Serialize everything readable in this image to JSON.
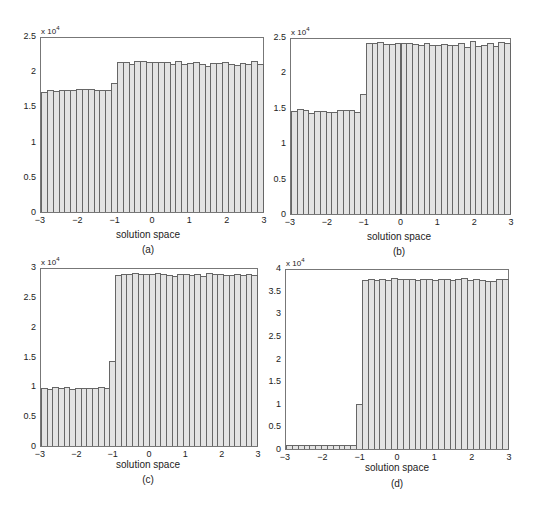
{
  "chart_data": [
    {
      "type": "bar",
      "panel": "(a)",
      "caption": "(a)",
      "xlabel": "solution space",
      "ylabel": "",
      "y_multiplier": "x 10",
      "y_exponent": "4",
      "xlim": [
        -3,
        3
      ],
      "ylim": [
        0,
        2.5
      ],
      "xticks": [
        "-3",
        "-2",
        "-1",
        "0",
        "1",
        "2",
        "3"
      ],
      "yticks": [
        "0",
        "0.5",
        "1",
        "1.5",
        "2",
        "2.5"
      ],
      "bin_width": 0.2,
      "values": [
        1.73,
        1.76,
        1.74,
        1.75,
        1.76,
        1.75,
        1.77,
        1.77,
        1.77,
        1.75,
        1.75,
        1.76,
        1.86,
        2.15,
        2.15,
        2.13,
        2.17,
        2.17,
        2.16,
        2.15,
        2.16,
        2.15,
        2.12,
        2.17,
        2.12,
        2.14,
        2.16,
        2.13,
        2.1,
        2.14,
        2.14,
        2.15,
        2.13,
        2.11,
        2.14,
        2.12,
        2.17,
        2.13
      ]
    },
    {
      "type": "bar",
      "panel": "(b)",
      "caption": "(b)",
      "xlabel": "solution space",
      "y_multiplier": "x 10",
      "y_exponent": "4",
      "xlim": [
        -3,
        3
      ],
      "ylim": [
        0,
        2.5
      ],
      "xticks": [
        "-3",
        "-2",
        "-1",
        "0",
        "1",
        "2",
        "3"
      ],
      "yticks": [
        "0",
        "0.5",
        "1",
        "1.5",
        "2",
        "2.5"
      ],
      "bin_width": 0.2,
      "values": [
        1.47,
        1.5,
        1.48,
        1.45,
        1.47,
        1.47,
        1.46,
        1.46,
        1.48,
        1.49,
        1.48,
        1.46,
        1.72,
        2.44,
        2.44,
        2.46,
        2.43,
        2.43,
        2.44,
        2.44,
        2.45,
        2.43,
        2.42,
        2.44,
        2.41,
        2.42,
        2.43,
        2.42,
        2.42,
        2.45,
        2.39,
        2.47,
        2.4,
        2.41,
        2.45,
        2.4,
        2.46,
        2.45
      ]
    },
    {
      "type": "bar",
      "panel": "(c)",
      "caption": "(c)",
      "xlabel": "solution space",
      "y_multiplier": "x 10",
      "y_exponent": "4",
      "xlim": [
        -3,
        3
      ],
      "ylim": [
        0,
        3
      ],
      "xticks": [
        "-3",
        "-2",
        "-1",
        "0",
        "1",
        "2",
        "3"
      ],
      "yticks": [
        "0",
        "0.5",
        "1",
        "1.5",
        "2",
        "2.5",
        "3"
      ],
      "bin_width": 0.2,
      "values": [
        0.98,
        0.97,
        1.0,
        0.98,
        1.0,
        0.97,
        0.98,
        0.98,
        0.98,
        0.99,
        1.0,
        0.98,
        1.44,
        2.9,
        2.91,
        2.92,
        2.93,
        2.92,
        2.91,
        2.91,
        2.93,
        2.92,
        2.9,
        2.89,
        2.91,
        2.92,
        2.9,
        2.92,
        2.89,
        2.93,
        2.92,
        2.91,
        2.9,
        2.9,
        2.91,
        2.9,
        2.91,
        2.9
      ]
    },
    {
      "type": "bar",
      "panel": "(d)",
      "caption": "(d)",
      "xlabel": "solution space",
      "y_multiplier": "x 10",
      "y_exponent": "4",
      "xlim": [
        -3,
        3
      ],
      "ylim": [
        0,
        4
      ],
      "xticks": [
        "-3",
        "-2",
        "-1",
        "0",
        "1",
        "2",
        "3"
      ],
      "yticks": [
        "0",
        "0.5",
        "1",
        "1.5",
        "2",
        "2.5",
        "3",
        "3.5",
        "4"
      ],
      "bin_width": 0.2,
      "values": [
        0.1,
        0.09,
        0.09,
        0.09,
        0.09,
        0.09,
        0.09,
        0.09,
        0.09,
        0.09,
        0.09,
        0.09,
        1.0,
        3.78,
        3.8,
        3.78,
        3.8,
        3.78,
        3.83,
        3.81,
        3.79,
        3.8,
        3.78,
        3.81,
        3.8,
        3.78,
        3.79,
        3.8,
        3.78,
        3.8,
        3.83,
        3.78,
        3.79,
        3.78,
        3.75,
        3.75,
        3.8,
        3.79
      ]
    }
  ]
}
